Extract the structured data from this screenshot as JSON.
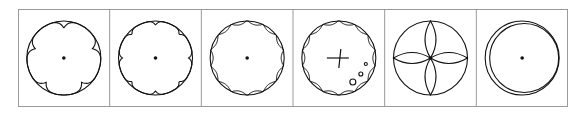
{
  "figure": {
    "border_color": "#9a9a9a",
    "stroke_color": "#111111",
    "panels": [
      {
        "id": 1,
        "shape": "five-lobed outline inside circle",
        "lobes": 5,
        "center_dot": true
      },
      {
        "id": 2,
        "shape": "eight-lobed outline inside circle",
        "lobes": 8,
        "center_dot": true
      },
      {
        "id": 3,
        "shape": "scalloped circle with many notches",
        "lobes": 14,
        "center_dot": true
      },
      {
        "id": 4,
        "shape": "scalloped circle with cross and small circles",
        "lobes": 14,
        "center_dot": false,
        "cross": true,
        "small_circles": 3
      },
      {
        "id": 5,
        "shape": "circle with four-petal rosette",
        "petals": 4,
        "center_dot": true
      },
      {
        "id": 6,
        "shape": "double offset circles",
        "center_dot": true
      }
    ]
  }
}
